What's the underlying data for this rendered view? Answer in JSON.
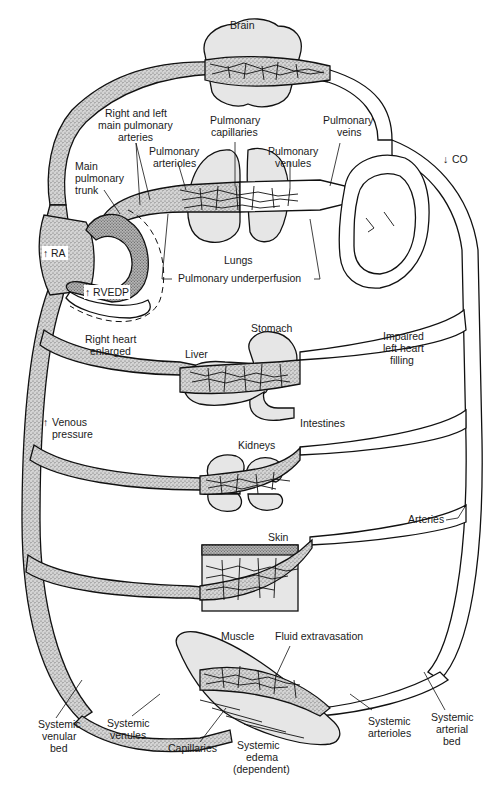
{
  "figure": {
    "type": "anatomical circulation diagram",
    "colors": {
      "line": "#111111",
      "background": "#ffffff",
      "venous_stipple": "#8a8a8a",
      "organ_fill": "#e6e6e6"
    }
  },
  "labels": {
    "brain": "Brain",
    "rl_pulm_arteries_1": "Right and left",
    "rl_pulm_arteries_2": "main pulmonary",
    "rl_pulm_arteries_3": "arteries",
    "pulm_capillaries_1": "Pulmonary",
    "pulm_capillaries_2": "capillaries",
    "pulm_veins_1": "Pulmonary",
    "pulm_veins_2": "veins",
    "co_arrow": "↓",
    "co": "CO",
    "main_pulm_trunk_1": "Main",
    "main_pulm_trunk_2": "pulmonary",
    "main_pulm_trunk_3": "trunk",
    "pulm_arterioles_1": "Pulmonary",
    "pulm_arterioles_2": "arterioles",
    "pulm_venules_1": "Pulmonary",
    "pulm_venules_2": "venules",
    "ra_arrow": "↑",
    "ra": "RA",
    "lungs": "Lungs",
    "rvedp_arrow": "↑",
    "rvedp": "RVEDP",
    "pulm_underperfusion": "Pulmonary underperfusion",
    "right_heart_1": "Right heart",
    "right_heart_2": "enlarged",
    "stomach": "Stomach",
    "liver": "Liver",
    "impaired_1": "Impaired",
    "impaired_2": "left heart",
    "impaired_3": "filling",
    "intestines": "Intestines",
    "venous_arrow": "↑",
    "venous_1": "Venous",
    "venous_2": "pressure",
    "kidneys": "Kidneys",
    "arteries": "Arteries",
    "skin": "Skin",
    "muscle": "Muscle",
    "fluid_extravasation": "Fluid extravasation",
    "sys_venular_bed_1": "Systemic",
    "sys_venular_bed_2": "venular",
    "sys_venular_bed_3": "bed",
    "sys_venules_1": "Systemic",
    "sys_venules_2": "venules",
    "capillaries": "Capillaries",
    "sys_edema_1": "Systemic",
    "sys_edema_2": "edema",
    "sys_edema_3": "(dependent)",
    "sys_arterioles_1": "Systemic",
    "sys_arterioles_2": "arterioles",
    "sys_arterial_bed_1": "Systemic",
    "sys_arterial_bed_2": "arterial",
    "sys_arterial_bed_3": "bed"
  },
  "organs": [
    {
      "name": "Brain",
      "vascular_bed": "brain"
    },
    {
      "name": "Lungs",
      "vascular_bed": "pulmonary"
    },
    {
      "name": "Liver / Stomach / Intestines",
      "vascular_bed": "splanchnic"
    },
    {
      "name": "Kidneys",
      "vascular_bed": "renal"
    },
    {
      "name": "Skin",
      "vascular_bed": "cutaneous"
    },
    {
      "name": "Muscle",
      "vascular_bed": "skeletal muscle"
    }
  ],
  "indicators": [
    {
      "label": "RA",
      "direction": "up"
    },
    {
      "label": "RVEDP",
      "direction": "up"
    },
    {
      "label": "Venous pressure",
      "direction": "up"
    },
    {
      "label": "CO",
      "direction": "down"
    }
  ]
}
